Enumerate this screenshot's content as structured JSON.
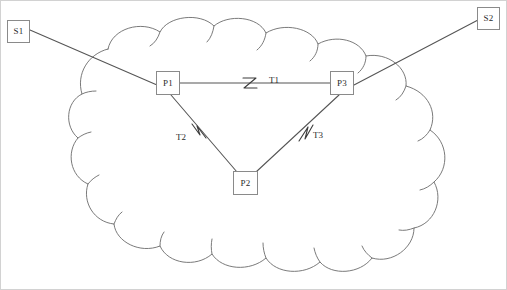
{
  "figure": {
    "kind": "network-topology-diagram",
    "background_color": "#ffffff",
    "line_color": "#555555",
    "cloud_line_color": "#6b6b6b",
    "text_color": "#2b2b2b",
    "border_color": "#c9c9c9",
    "width": 507,
    "height": 290
  },
  "cloud": {
    "name": "network-cloud",
    "label": ""
  },
  "nodes": [
    {
      "id": "S1",
      "label": "S1",
      "x": 7,
      "y": 20,
      "w": 23,
      "h": 23,
      "inside_cloud": false
    },
    {
      "id": "S2",
      "label": "S2",
      "x": 477,
      "y": 7,
      "w": 23,
      "h": 23,
      "inside_cloud": false
    },
    {
      "id": "P1",
      "label": "P1",
      "x": 156,
      "y": 71,
      "w": 24,
      "h": 24,
      "inside_cloud": true
    },
    {
      "id": "P3",
      "label": "P3",
      "x": 330,
      "y": 71,
      "w": 24,
      "h": 24,
      "inside_cloud": true
    },
    {
      "id": "P2",
      "label": "P2",
      "x": 233,
      "y": 171,
      "w": 25,
      "h": 24,
      "inside_cloud": true
    }
  ],
  "links": [
    {
      "id": "S1-P1",
      "from": "S1",
      "to": "P1",
      "label": "",
      "x1": 30,
      "y1": 30,
      "x2": 156,
      "y2": 85,
      "tick": false
    },
    {
      "id": "P3-S2",
      "from": "P3",
      "to": "S2",
      "label": "",
      "x1": 354,
      "y1": 85,
      "x2": 477,
      "y2": 20,
      "tick": false
    },
    {
      "id": "P1-P3",
      "from": "P1",
      "to": "P3",
      "label": "T1",
      "x1": 180,
      "y1": 83,
      "x2": 330,
      "y2": 83,
      "tick": true,
      "tick_x": 250,
      "tick_y": 83,
      "label_x": 269,
      "label_y": 77
    },
    {
      "id": "P1-P2",
      "from": "P1",
      "to": "P2",
      "label": "T2",
      "x1": 171,
      "y1": 95,
      "x2": 236,
      "y2": 171,
      "tick": true,
      "tick_x": 200,
      "tick_y": 131,
      "label_x": 176,
      "label_y": 134
    },
    {
      "id": "P3-P2",
      "from": "P3",
      "to": "P2",
      "label": "T3",
      "x1": 339,
      "y1": 95,
      "x2": 256,
      "y2": 171,
      "tick": true,
      "tick_x": 305,
      "tick_y": 134,
      "label_x": 313,
      "label_y": 132
    }
  ],
  "labels": {
    "T1": "T1",
    "T2": "T2",
    "T3": "T3",
    "S1": "S1",
    "S2": "S2",
    "P1": "P1",
    "P2": "P2",
    "P3": "P3"
  }
}
